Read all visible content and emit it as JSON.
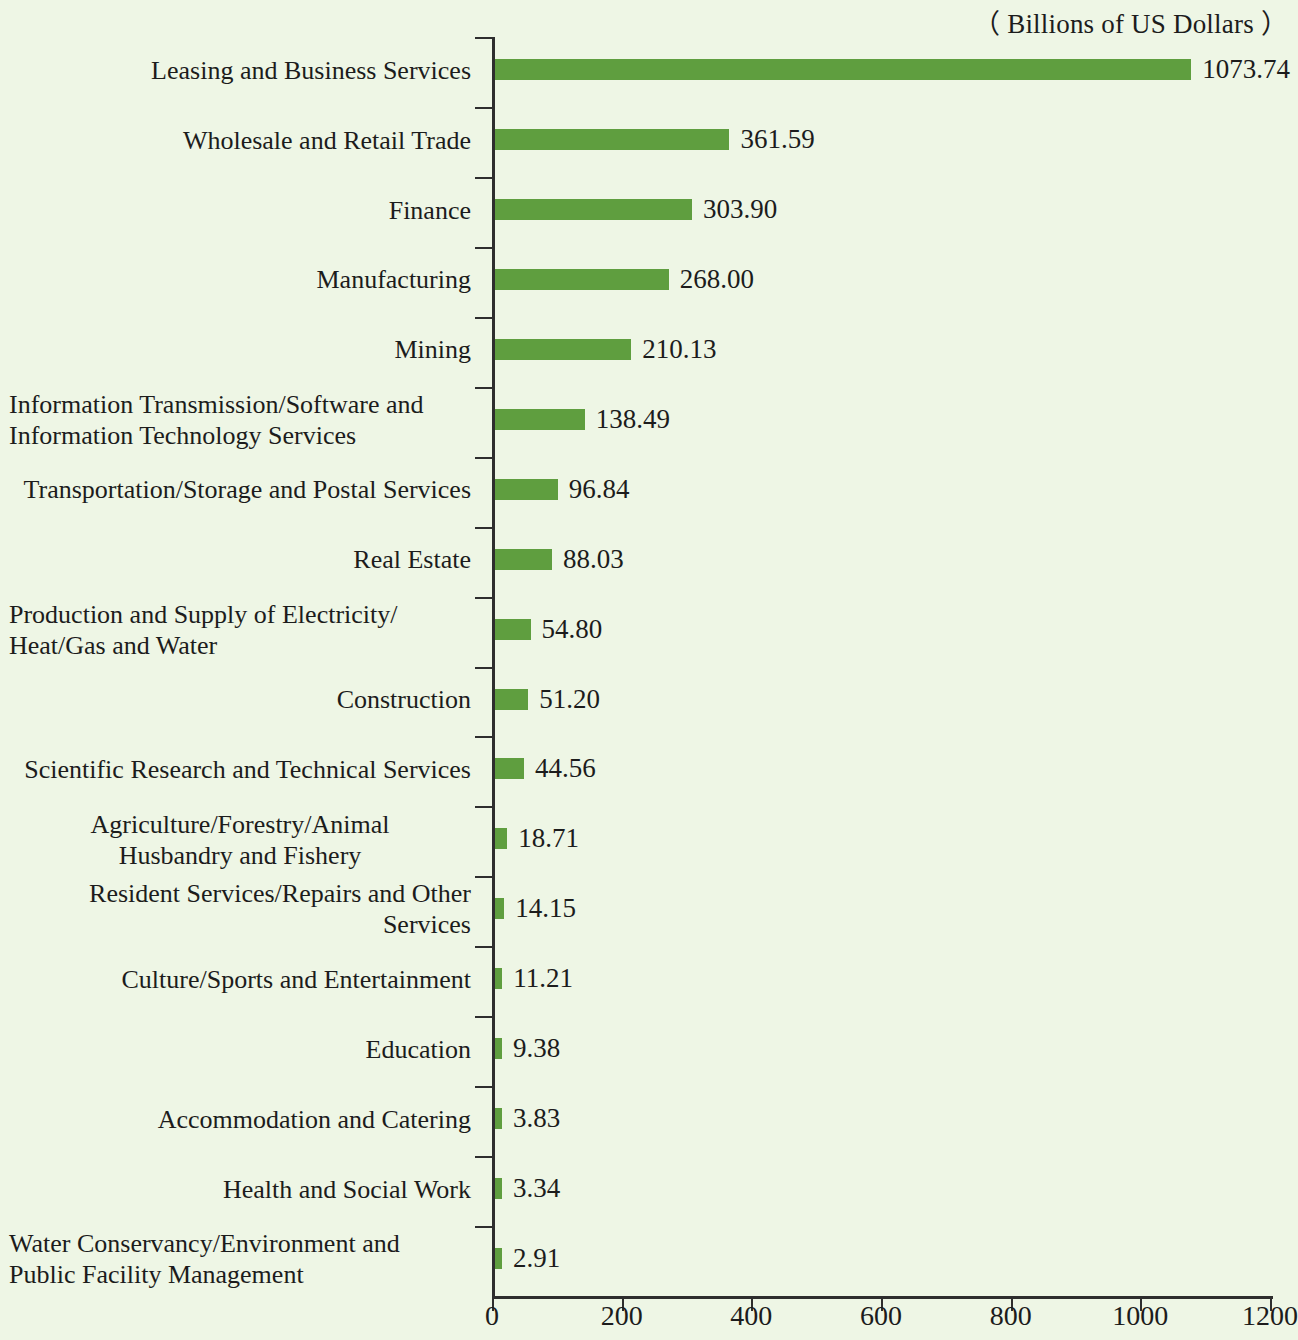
{
  "units_note": "（ Billions of US Dollars ）",
  "chart_data": {
    "type": "bar",
    "orientation": "horizontal",
    "title": "",
    "subtitle": "",
    "xlabel": "",
    "ylabel": "",
    "unit_note": "( Billions of US Dollars )",
    "xlim": [
      0,
      1200
    ],
    "xticks": [
      0,
      200,
      400,
      600,
      800,
      1000,
      1200
    ],
    "xtick_labels": [
      "0",
      "200",
      "400",
      "600",
      "800",
      "1000",
      "1200"
    ],
    "grid": false,
    "legend": null,
    "bar_color": "#5f9e3f",
    "background_color": "#eef6e5",
    "categories": [
      "Leasing and Business Services",
      "Wholesale and Retail Trade",
      "Finance",
      "Manufacturing",
      "Mining",
      "Information Transmission/Software and\nInformation Technology Services",
      "Transportation/Storage and Postal Services",
      "Real Estate",
      "Production and Supply of Electricity/\nHeat/Gas and Water",
      "Construction",
      "Scientific Research and Technical Services",
      "Agriculture/Forestry/Animal\nHusbandry and Fishery",
      "Resident Services/Repairs and Other Services",
      "Culture/Sports and Entertainment",
      "Education",
      "Accommodation and Catering",
      "Health and Social Work",
      "Water Conservancy/Environment and\nPublic Facility Management"
    ],
    "values": [
      1073.74,
      361.59,
      303.9,
      268.0,
      210.13,
      138.49,
      96.84,
      88.03,
      54.8,
      51.2,
      44.56,
      18.71,
      14.15,
      11.21,
      9.38,
      3.83,
      3.34,
      2.91
    ],
    "value_labels": [
      "1073.74",
      "361.59",
      "303.90",
      "268.00",
      "210.13",
      "138.49",
      "96.84",
      "88.03",
      "54.80",
      "51.20",
      "44.56",
      "18.71",
      "14.15",
      "11.21",
      "9.38",
      "3.83",
      "3.34",
      "2.91"
    ],
    "label_align": [
      "right",
      "right",
      "right",
      "right",
      "right",
      "left",
      "right",
      "right",
      "left",
      "right",
      "right",
      "center",
      "right",
      "right",
      "right",
      "right",
      "right",
      "left"
    ]
  }
}
